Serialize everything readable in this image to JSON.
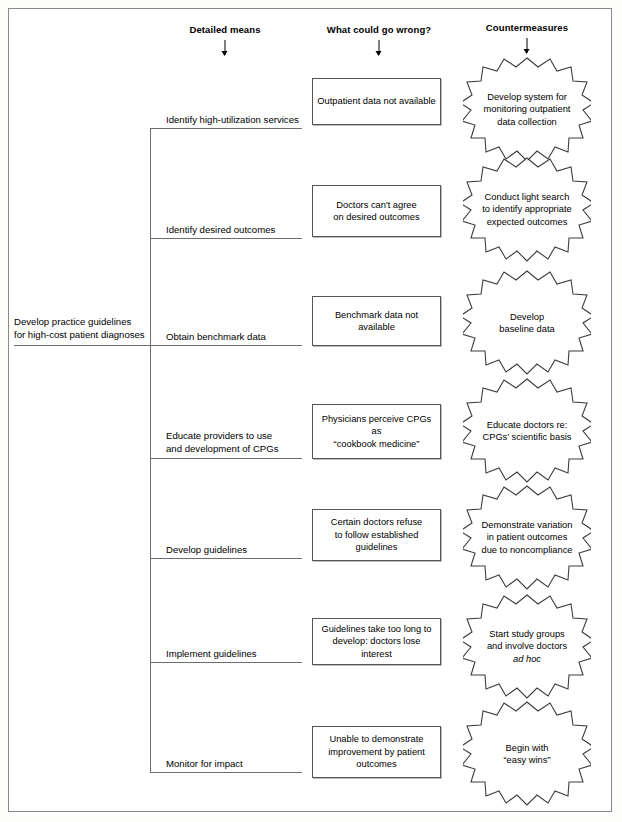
{
  "diagram": {
    "type": "tree-diagram",
    "title": "Develop practice guidelines for high-cost patient diagnoses",
    "columns": [
      {
        "label": "Detailed means",
        "icon": "down-arrow-icon"
      },
      {
        "label": "What could go wrong?",
        "icon": "down-arrow-icon"
      },
      {
        "label": "Countermeasures",
        "icon": "down-arrow-icon"
      }
    ],
    "root": {
      "line1": "Develop practice guidelines",
      "line2": "for high-cost patient diagnoses"
    },
    "rows": [
      {
        "means": [
          "Identify high-utilization services"
        ],
        "problem": [
          "Outpatient data not available"
        ],
        "countermeasure": [
          "Develop system for",
          "monitoring outpatient",
          "data collection"
        ]
      },
      {
        "means": [
          "Identify desired outcomes"
        ],
        "problem": [
          "Doctors can't agree",
          "on desired outcomes"
        ],
        "countermeasure": [
          "Conduct light search",
          "to identify appropriate",
          "expected outcomes"
        ]
      },
      {
        "means": [
          "Obtain benchmark data"
        ],
        "problem": [
          "Benchmark data not available"
        ],
        "countermeasure": [
          "Develop",
          "baseline data"
        ]
      },
      {
        "means": [
          "Educate providers to use",
          "and development of CPGs"
        ],
        "problem": [
          "Physicians perceive CPGs as",
          "“cookbook medicine”"
        ],
        "countermeasure": [
          "Educate doctors re:",
          "CPGs’ scientific basis"
        ]
      },
      {
        "means": [
          "Develop guidelines"
        ],
        "problem": [
          "Certain doctors refuse",
          "to follow established",
          "guidelines"
        ],
        "countermeasure": [
          "Demonstrate variation",
          "in patient outcomes",
          "due to noncompliance"
        ]
      },
      {
        "means": [
          "Implement guidelines"
        ],
        "problem": [
          "Guidelines take too long to",
          "develop: doctors lose interest"
        ],
        "countermeasure": [
          "Start study groups",
          "and involve doctors",
          "ad hoc"
        ],
        "countermeasure_italic_line": 2
      },
      {
        "means": [
          "Monitor for impact"
        ],
        "problem": [
          "Unable to demonstrate",
          "improvement by patient",
          "outcomes"
        ],
        "countermeasure": [
          "Begin with",
          "“easy wins”"
        ]
      }
    ],
    "colors": {
      "line": "#6d6d6d",
      "box_border": "#555555",
      "page_border": "#8a8a8a",
      "text": "#000000",
      "background": "#ffffff"
    }
  }
}
